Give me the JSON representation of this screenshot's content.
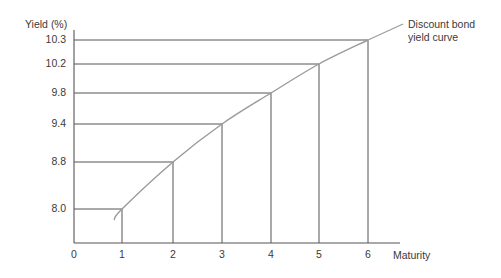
{
  "chart_data": {
    "type": "line",
    "title": "",
    "xlabel": "Maturity",
    "ylabel": "Yield (%)",
    "x": [
      1,
      2,
      3,
      4,
      5,
      6
    ],
    "series": [
      {
        "name": "Discount bond yield curve",
        "values": [
          8.0,
          8.8,
          9.4,
          9.8,
          10.2,
          10.3
        ]
      }
    ],
    "x_ticks": [
      "0",
      "1",
      "2",
      "3",
      "4",
      "5",
      "6"
    ],
    "y_ticks": [
      "8.0",
      "8.8",
      "9.4",
      "9.8",
      "10.2",
      "10.3"
    ],
    "annotation": "Discount bond yield curve",
    "grid": false,
    "reference_lines": "horizontal and vertical drop lines from each point to axes",
    "legend": "none (curve labeled directly at upper right)"
  },
  "labels": {
    "ylabel": "Yield (%)",
    "xlabel": "Maturity",
    "curve_label_line1": "Discount bond",
    "curve_label_line2": "yield curve",
    "origin": "0"
  },
  "colors": {
    "axis": "#555555",
    "curve": "#9a9a9a",
    "text": "#3a3a3a"
  }
}
